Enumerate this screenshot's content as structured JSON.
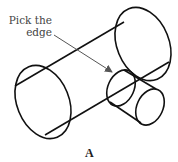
{
  "annotation": {
    "line1": "Pick the",
    "line2": "edge"
  },
  "caption": "A",
  "colors": {
    "stroke": "#111111",
    "arrow": "#555555",
    "text": "#444444"
  },
  "shapes": {
    "large_cylinder": {
      "left_end": [
        43,
        102
      ],
      "right_end": [
        143,
        44
      ]
    },
    "small_cylinder": {
      "left_end": [
        121,
        88
      ],
      "right_end": [
        150,
        106
      ]
    }
  }
}
